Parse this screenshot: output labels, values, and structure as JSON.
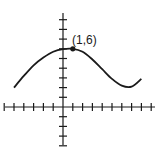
{
  "chart_data": {
    "type": "line",
    "title": "",
    "xlabel": "",
    "ylabel": "",
    "x_axis": {
      "min": -6,
      "max": 9,
      "tick_spacing": 1,
      "grid": false
    },
    "y_axis": {
      "min": -4,
      "max": 9,
      "tick_spacing": 1,
      "grid": false
    },
    "series": [
      {
        "name": "f(x)",
        "x": [
          -5,
          -4,
          -3,
          -2,
          -1,
          0,
          1,
          2,
          3,
          4,
          5,
          6,
          7,
          8
        ],
        "y": [
          2.0,
          3.2,
          4.3,
          5.1,
          5.7,
          5.97,
          6.0,
          5.7,
          4.9,
          3.9,
          2.9,
          2.2,
          2.1,
          2.9
        ]
      }
    ],
    "annotations": [
      {
        "point": [
          1,
          6
        ],
        "label": "(1,6)",
        "marker": "filled-dot"
      }
    ]
  },
  "labels": {
    "point_label": "(1,6)"
  }
}
